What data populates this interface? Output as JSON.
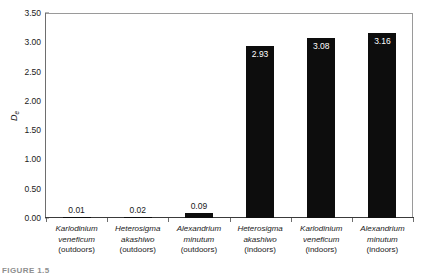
{
  "chart_data": {
    "type": "bar",
    "title": "",
    "xlabel": "",
    "ylabel": "De",
    "ylabel_base": "D",
    "ylabel_sub": "e",
    "ylim": [
      0.0,
      3.5
    ],
    "ytick_step": 0.5,
    "grid": false,
    "legend": null,
    "bar_color": "#0d0d0d",
    "frame_color": "#9a9a9a",
    "categories": [
      "Karlodinium veneficum (outdoors)",
      "Heterosigma akashiwo (outdoors)",
      "Alexandrium minutum (outdoors)",
      "Heterosigma akashiwo (indoors)",
      "Karlodinium veneficum (indoors)",
      "Alexandrium minutum (indoors)"
    ],
    "category_parts": [
      {
        "genus": "Karlodinium",
        "species": "veneficum",
        "condition": "(outdoors)"
      },
      {
        "genus": "Heterosigma",
        "species": "akashiwo",
        "condition": "(outdoors)"
      },
      {
        "genus": "Alexandrium",
        "species": "minutum",
        "condition": "(outdoors)"
      },
      {
        "genus": "Heterosigma",
        "species": "akashiwo",
        "condition": "(indoors)"
      },
      {
        "genus": "Karlodinium",
        "species": "veneficum",
        "condition": "(indoors)"
      },
      {
        "genus": "Alexandrium",
        "species": "minutum",
        "condition": "(indoors)"
      }
    ],
    "values": [
      0.01,
      0.02,
      0.09,
      2.93,
      3.08,
      3.16
    ],
    "value_labels": [
      "0.01",
      "0.02",
      "0.09",
      "2.93",
      "3.08",
      "3.16"
    ],
    "label_placement": [
      "above",
      "above",
      "above",
      "inside",
      "inside",
      "inside"
    ],
    "ytick_labels": [
      "0.00",
      "0.50",
      "1.00",
      "1.50",
      "2.00",
      "2.50",
      "3.00",
      "3.50"
    ],
    "ytick_values": [
      0.0,
      0.5,
      1.0,
      1.5,
      2.0,
      2.5,
      3.0,
      3.5
    ]
  },
  "caption": {
    "text": "FIGURE 1.5"
  }
}
